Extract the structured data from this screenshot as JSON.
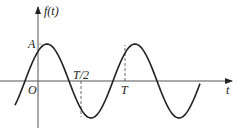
{
  "diagram": {
    "y_axis_label": "f(t)",
    "x_axis_label": "t",
    "origin_label": "O",
    "amplitude_label": "A",
    "half_period_label": "T/2",
    "period_label": "T",
    "colors": {
      "line": "#222222",
      "axis": "#555555"
    }
  }
}
